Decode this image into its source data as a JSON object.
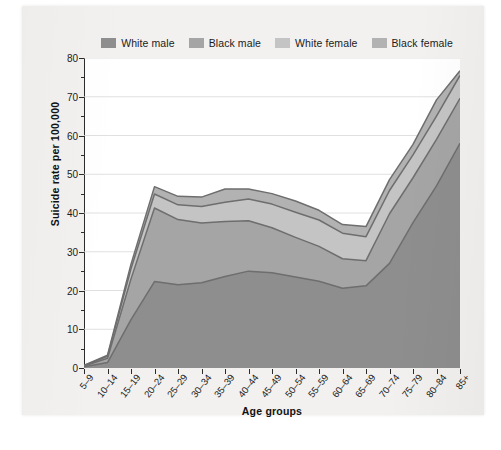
{
  "chart_data": {
    "type": "area",
    "stacked": true,
    "title": "",
    "xlabel": "Age groups",
    "ylabel": "Suicide rate per 100,000",
    "categories": [
      "5–9",
      "10–14",
      "15–19",
      "20–24",
      "25–29",
      "30–34",
      "35–39",
      "40–44",
      "45–49",
      "50–54",
      "55–59",
      "60–64",
      "65–69",
      "70–74",
      "75–79",
      "80–84",
      "85+"
    ],
    "ylim": [
      0,
      80
    ],
    "yticks": [
      0,
      10,
      20,
      30,
      40,
      50,
      60,
      70,
      80
    ],
    "yticks_minor": [
      5,
      15,
      25,
      35,
      45,
      55,
      65,
      75
    ],
    "grid": true,
    "legend_position": "top",
    "series": [
      {
        "name": "White male",
        "color": "#8e8e8e",
        "values": [
          0.3,
          1.4,
          12.5,
          22.3,
          21.5,
          22.0,
          23.6,
          25.0,
          24.6,
          23.5,
          22.4,
          20.6,
          21.2,
          27.0,
          37.5,
          47.0,
          58.0
        ]
      },
      {
        "name": "Black male",
        "color": "#a5a5a5",
        "values": [
          0.2,
          1.1,
          10.5,
          19.0,
          16.8,
          15.4,
          14.2,
          13.0,
          11.6,
          10.2,
          9.0,
          7.6,
          6.5,
          12.8,
          11.6,
          12.0,
          11.6
        ]
      },
      {
        "name": "White female",
        "color": "#c4c4c4",
        "values": [
          0.1,
          0.5,
          2.6,
          3.6,
          3.8,
          4.3,
          5.0,
          5.6,
          6.1,
          6.5,
          6.8,
          6.6,
          6.2,
          6.0,
          5.9,
          6.0,
          5.9
        ]
      },
      {
        "name": "Black female",
        "color": "#b2b2b2",
        "values": [
          0.1,
          0.3,
          1.2,
          1.9,
          2.2,
          2.4,
          3.4,
          2.6,
          2.7,
          2.9,
          2.5,
          2.2,
          2.6,
          2.8,
          2.7,
          4.2,
          1.2
        ]
      }
    ]
  },
  "legend": {
    "items": [
      {
        "label": "White male",
        "color": "#8e8e8e"
      },
      {
        "label": "Black male",
        "color": "#a5a5a5"
      },
      {
        "label": "White female",
        "color": "#c4c4c4"
      },
      {
        "label": "Black female",
        "color": "#b2b2b2"
      }
    ]
  },
  "axis": {
    "y_label": "Suicide rate per 100,000",
    "x_label": "Age groups",
    "y_ticks": [
      "0",
      "10",
      "20",
      "30",
      "40",
      "50",
      "60",
      "70",
      "80"
    ]
  },
  "colors": {
    "axis": "#2b2b2b",
    "grid": "#d8d8d8",
    "plot_background": "#ffffff",
    "page_background": "#f2f1ef",
    "line": "#6e6e6e"
  }
}
